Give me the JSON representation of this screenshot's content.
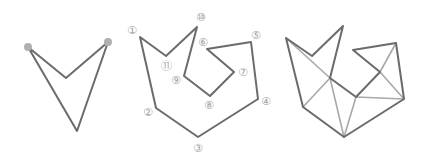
{
  "figures": [
    {
      "id": "dart",
      "description": "Simple polygon (dart shape) with two highlighted vertices",
      "vertices": [
        [
          28,
          47
        ],
        [
          66,
          78
        ],
        [
          108,
          42
        ],
        [
          77,
          131
        ]
      ],
      "highlighted_vertices": [
        [
          28,
          47
        ],
        [
          108,
          42
        ]
      ]
    },
    {
      "id": "labeled-polygon",
      "description": "11-vertex simple polygon with numbered vertices",
      "vertices": [
        [
          140,
          37
        ],
        [
          156,
          108
        ],
        [
          198,
          137
        ],
        [
          258,
          99
        ],
        [
          251,
          42
        ],
        [
          207,
          49
        ],
        [
          234,
          72
        ],
        [
          210,
          96
        ],
        [
          184,
          76
        ],
        [
          197,
          27
        ],
        [
          166,
          56
        ]
      ],
      "labels": [
        {
          "text": "①",
          "x": 132,
          "y": 30
        },
        {
          "text": "②",
          "x": 148,
          "y": 112
        },
        {
          "text": "③",
          "x": 198,
          "y": 148
        },
        {
          "text": "④",
          "x": 266,
          "y": 101
        },
        {
          "text": "⑤",
          "x": 256,
          "y": 35
        },
        {
          "text": "⑥",
          "x": 203,
          "y": 42
        },
        {
          "text": "⑦",
          "x": 243,
          "y": 72
        },
        {
          "text": "⑧",
          "x": 209,
          "y": 105
        },
        {
          "text": "⑨",
          "x": 176,
          "y": 80
        },
        {
          "text": "⑩",
          "x": 201,
          "y": 17
        },
        {
          "text": "⑪",
          "x": 166,
          "y": 66
        }
      ]
    },
    {
      "id": "triangulated-polygon",
      "description": "Same polygon with triangulation diagonals",
      "vertices": [
        [
          286,
          38
        ],
        [
          303,
          107
        ],
        [
          344,
          137
        ],
        [
          404,
          99
        ],
        [
          396,
          43
        ],
        [
          353,
          50
        ],
        [
          380,
          72
        ],
        [
          356,
          97
        ],
        [
          330,
          78
        ],
        [
          343,
          26
        ],
        [
          312,
          56
        ]
      ],
      "diagonals": [
        [
          0,
          8
        ],
        [
          8,
          1
        ],
        [
          8,
          2
        ],
        [
          7,
          2
        ],
        [
          7,
          3
        ],
        [
          6,
          3
        ],
        [
          6,
          4
        ]
      ]
    }
  ]
}
